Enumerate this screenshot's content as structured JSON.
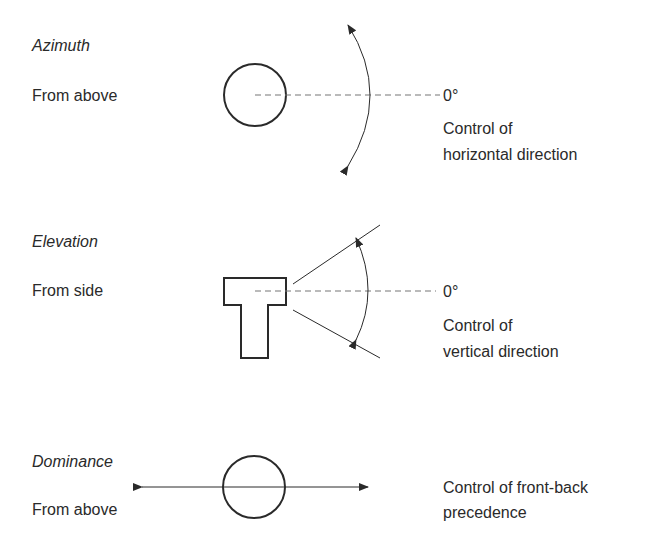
{
  "sections": [
    {
      "title": "Azimuth",
      "view": "From above",
      "zero_label": "0°",
      "description_line1": "Control of",
      "description_line2": "horizontal direction"
    },
    {
      "title": "Elevation",
      "view": "From side",
      "zero_label": "0°",
      "description_line1": "Control of",
      "description_line2": "vertical direction"
    },
    {
      "title": "Dominance",
      "view": "From above",
      "description_line1": "Control of front-back",
      "description_line2": "precedence"
    }
  ],
  "colors": {
    "ink": "#2a2a2a",
    "dash": "#777777",
    "background": "#ffffff"
  }
}
